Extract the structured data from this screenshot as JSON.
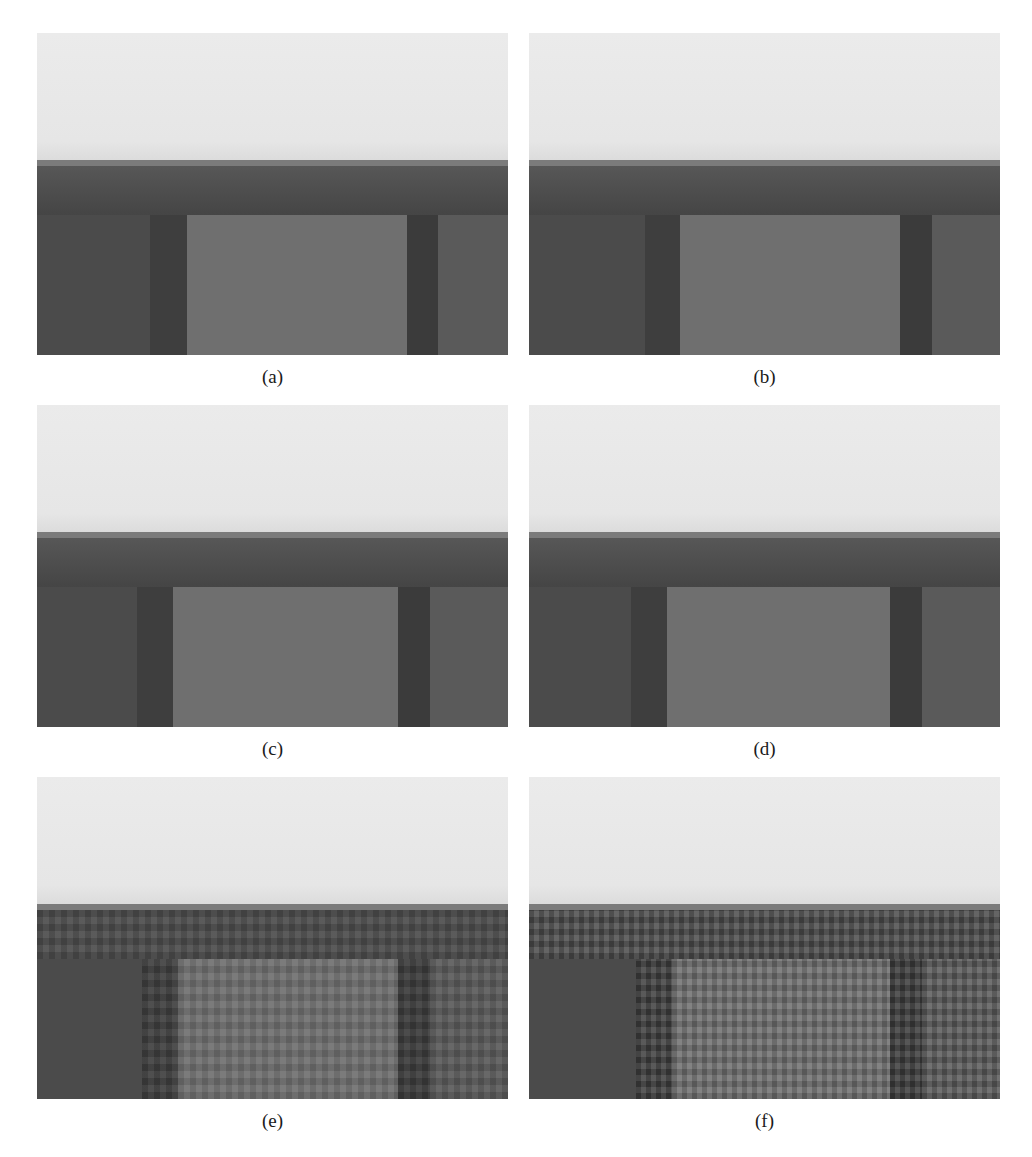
{
  "figure": {
    "top_cutoff_text": "",
    "panels": [
      {
        "id": "a",
        "caption": "(a)",
        "position": {
          "left": 37,
          "top": 33
        },
        "caption_top": 366,
        "regions": {
          "left_shadow": [
            113,
            150
          ],
          "inner": [
            150,
            370
          ],
          "col_dark": [
            370,
            401
          ],
          "right": [
            401,
            471
          ]
        },
        "noise": "none"
      },
      {
        "id": "b",
        "caption": "(b)",
        "position": {
          "left": 529,
          "top": 33
        },
        "caption_top": 366,
        "regions": {
          "left_shadow": [
            116,
            151
          ],
          "inner": [
            151,
            371
          ],
          "col_dark": [
            371,
            403
          ],
          "right": [
            403,
            471
          ]
        },
        "noise": "none"
      },
      {
        "id": "c",
        "caption": "(c)",
        "position": {
          "left": 37,
          "top": 405
        },
        "caption_top": 738,
        "regions": {
          "left_shadow": [
            100,
            136
          ],
          "inner": [
            136,
            361
          ],
          "col_dark": [
            361,
            393
          ],
          "right": [
            393,
            471
          ]
        },
        "noise": "none"
      },
      {
        "id": "d",
        "caption": "(d)",
        "position": {
          "left": 529,
          "top": 405
        },
        "caption_top": 738,
        "regions": {
          "left_shadow": [
            102,
            138
          ],
          "inner": [
            138,
            361
          ],
          "col_dark": [
            361,
            393
          ],
          "right": [
            393,
            471
          ]
        },
        "noise": "none"
      },
      {
        "id": "e",
        "caption": "(e)",
        "position": {
          "left": 37,
          "top": 777
        },
        "caption_top": 1110,
        "regions": {
          "left_shadow": [
            105,
            141
          ],
          "inner": [
            141,
            361
          ],
          "col_dark": [
            361,
            393
          ],
          "right": [
            393,
            471
          ]
        },
        "noise": "moderate"
      },
      {
        "id": "f",
        "caption": "(f)",
        "position": {
          "left": 529,
          "top": 777
        },
        "caption_top": 1110,
        "regions": {
          "left_shadow": [
            107,
            143
          ],
          "inner": [
            143,
            361
          ],
          "col_dark": [
            361,
            393
          ],
          "right": [
            393,
            471
          ]
        },
        "noise": "strong"
      }
    ],
    "colors": {
      "sky": "#e9e9e9",
      "edge_band": "#7b7b7b",
      "dark_body": "#4b4b4b",
      "inner_square": "#6f6f6f",
      "dark_column": "#3b3b3b",
      "right_region": "#5a5a5a"
    }
  }
}
